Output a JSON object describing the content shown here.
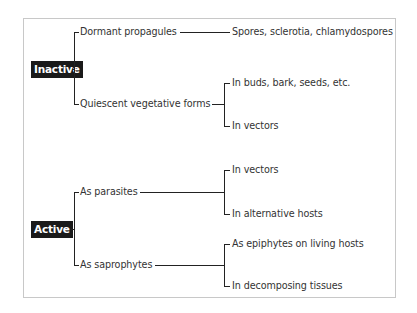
{
  "diagram": {
    "title": "",
    "groups": [
      {
        "label": "Inactive",
        "branches": [
          {
            "label": "Dormant propagules",
            "leaves": [
              "Spores, sclerotia, chlamydospores"
            ]
          },
          {
            "label": "Quiescent vegetative forms",
            "leaves": [
              "In buds, bark, seeds, etc.",
              "In vectors"
            ]
          }
        ]
      },
      {
        "label": "Active",
        "branches": [
          {
            "label": "As parasites",
            "leaves": [
              "In vectors",
              "In alternative hosts"
            ]
          },
          {
            "label": "As saprophytes",
            "leaves": [
              "As epiphytes on living hosts",
              "In decomposing tissues"
            ]
          }
        ]
      }
    ],
    "colors": {
      "category_bg": "#1a1a1a",
      "category_text": "#ffffff",
      "line": "#222222",
      "frame": "#c8c8c8"
    }
  }
}
